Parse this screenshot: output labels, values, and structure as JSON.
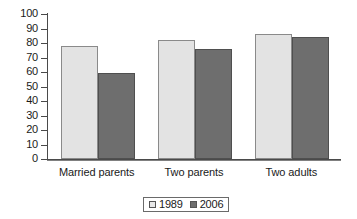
{
  "chart_data": {
    "type": "bar",
    "title": "",
    "subtitle": "",
    "xlabel": "",
    "ylabel": "",
    "categories": [
      "Married parents",
      "Two parents",
      "Two adults"
    ],
    "series": [
      {
        "name": "1989",
        "values": [
          78,
          82,
          86
        ],
        "color": "#e3e3e3"
      },
      {
        "name": "2006",
        "values": [
          59,
          76,
          84
        ],
        "color": "#6e6e6e"
      }
    ],
    "ylim": [
      0,
      100
    ],
    "ytick_step": 10,
    "yticks": [
      0,
      10,
      20,
      30,
      40,
      50,
      60,
      70,
      80,
      90,
      100
    ],
    "ytick_labels": [
      "0",
      "10",
      "20",
      "30",
      "40",
      "50",
      "60",
      "70",
      "80",
      "90",
      "100"
    ],
    "grid": false,
    "legend_position": "bottom",
    "legend_entries": [
      "1989",
      "2006"
    ],
    "annotations": []
  },
  "colors": {
    "series_1989": "#e3e3e3",
    "series_2006": "#6e6e6e",
    "axis": "#4a4a4a",
    "background": "#ffffff",
    "text": "#1a1a1a"
  }
}
